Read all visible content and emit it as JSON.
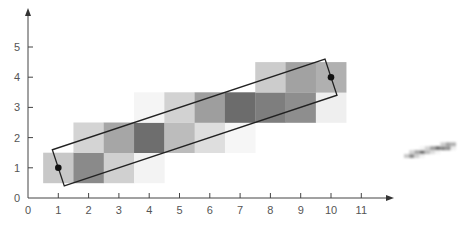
{
  "figure": {
    "x_axis": {
      "ticks": [
        "0",
        "1",
        "2",
        "3",
        "4",
        "5",
        "6",
        "7",
        "8",
        "9",
        "10",
        "11"
      ]
    },
    "y_axis": {
      "ticks": [
        "0",
        "1",
        "2",
        "3",
        "4",
        "5"
      ]
    },
    "cells": [
      {
        "x": 1,
        "y": 1,
        "gray": "#c8c8c8"
      },
      {
        "x": 2,
        "y": 1,
        "gray": "#8a8a8a"
      },
      {
        "x": 3,
        "y": 1,
        "gray": "#d0d0d0"
      },
      {
        "x": 4,
        "y": 1,
        "gray": "#f3f3f3"
      },
      {
        "x": 2,
        "y": 2,
        "gray": "#d4d4d4"
      },
      {
        "x": 3,
        "y": 2,
        "gray": "#a6a6a6"
      },
      {
        "x": 4,
        "y": 2,
        "gray": "#6e6e6e"
      },
      {
        "x": 5,
        "y": 2,
        "gray": "#bcbcbc"
      },
      {
        "x": 6,
        "y": 2,
        "gray": "#dedede"
      },
      {
        "x": 7,
        "y": 2,
        "gray": "#f6f6f6"
      },
      {
        "x": 4,
        "y": 3,
        "gray": "#f5f5f5"
      },
      {
        "x": 5,
        "y": 3,
        "gray": "#d2d2d2"
      },
      {
        "x": 6,
        "y": 3,
        "gray": "#9e9e9e"
      },
      {
        "x": 7,
        "y": 3,
        "gray": "#6c6c6c"
      },
      {
        "x": 8,
        "y": 3,
        "gray": "#7e7e7e"
      },
      {
        "x": 9,
        "y": 3,
        "gray": "#8e8e8e"
      },
      {
        "x": 10,
        "y": 3,
        "gray": "#efefef"
      },
      {
        "x": 8,
        "y": 4,
        "gray": "#cccccc"
      },
      {
        "x": 9,
        "y": 4,
        "gray": "#a2a2a2"
      },
      {
        "x": 10,
        "y": 4,
        "gray": "#b0b0b0"
      }
    ],
    "endpoints": [
      {
        "x": 1,
        "y": 1
      },
      {
        "x": 10,
        "y": 4
      }
    ],
    "rect_color": "#222222"
  }
}
